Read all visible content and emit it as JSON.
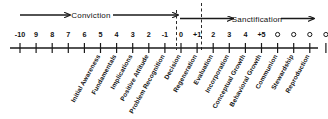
{
  "figure": {
    "bands": [
      {
        "name": "conviction",
        "label": "Conviction"
      },
      {
        "name": "sanctification",
        "label": "Sanctification"
      }
    ],
    "axis": {
      "ticks": [
        {
          "label": "-10"
        },
        {
          "label": "9"
        },
        {
          "label": "8"
        },
        {
          "label": "7"
        },
        {
          "label": "6"
        },
        {
          "label": "5"
        },
        {
          "label": "4"
        },
        {
          "label": "3"
        },
        {
          "label": "2"
        },
        {
          "label": "-1"
        },
        {
          "label": "0"
        },
        {
          "label": "+1"
        },
        {
          "label": "2"
        },
        {
          "label": "3"
        },
        {
          "label": "4"
        },
        {
          "label": "+5"
        },
        {
          "label": "o"
        },
        {
          "label": "o"
        },
        {
          "label": "o"
        },
        {
          "label": "o"
        }
      ]
    },
    "stages": [
      {
        "label": "Initial Awareness"
      },
      {
        "label": "Fundamentals"
      },
      {
        "label": "Implications"
      },
      {
        "label": "Positive Attitude"
      },
      {
        "label": "Problem Recognition"
      },
      {
        "label": "Decision"
      },
      {
        "label": "Regeneration"
      },
      {
        "label": "Evaluation"
      },
      {
        "label": "Incorporation"
      },
      {
        "label": "Conceptual Growth"
      },
      {
        "label": "Behavioral Growth"
      },
      {
        "label": "Communion"
      },
      {
        "label": "Stewardship"
      },
      {
        "label": "Reproduction"
      }
    ],
    "colors": {
      "ink": "#111111",
      "line": "#1a1a1a",
      "background": "#ffffff"
    }
  }
}
